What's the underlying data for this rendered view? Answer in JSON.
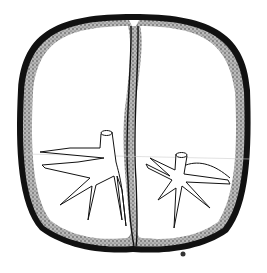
{
  "figure": {
    "mark": "small circled symbol at bottom right",
    "colors": {
      "outer_wall": "#111111",
      "stipple_layer": "#8a8a8a",
      "background": "#ffffff",
      "line": "#111111"
    }
  }
}
